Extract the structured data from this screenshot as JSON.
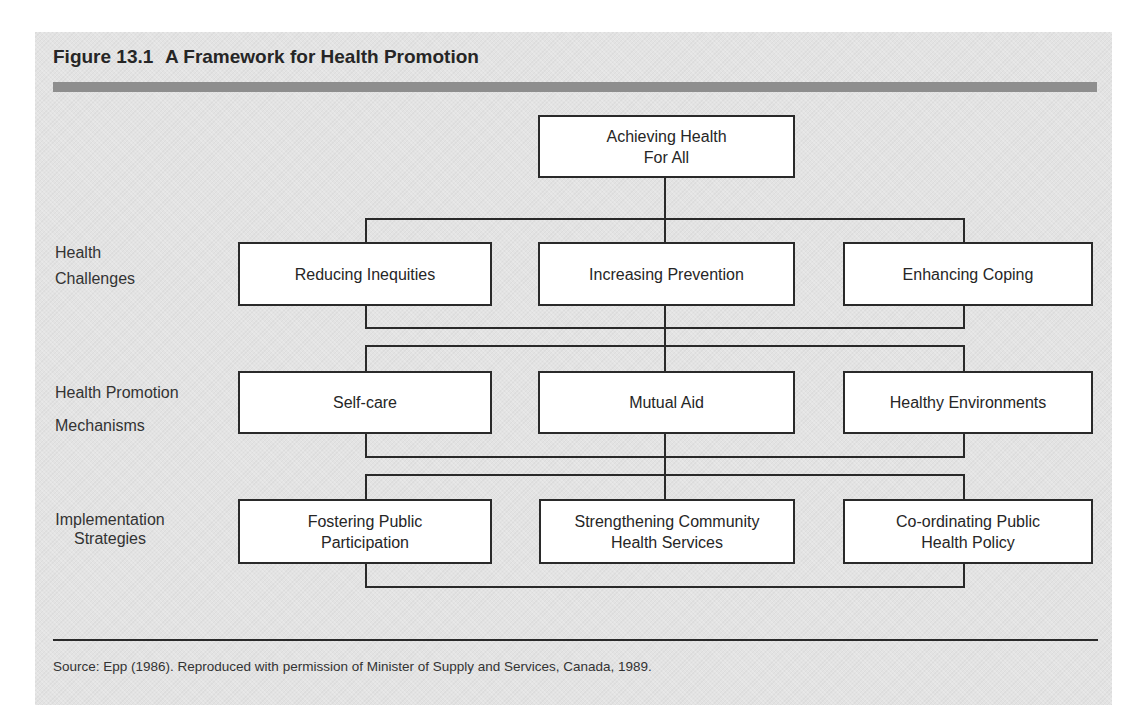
{
  "figure": {
    "number": "Figure 13.1",
    "title": "A Framework for Health Promotion",
    "source": "Source:  Epp (1986). Reproduced with permission of Minister of Supply and Services, Canada, 1989."
  },
  "diagram": {
    "root": {
      "line1": "Achieving Health",
      "line2": "For All"
    },
    "rows": [
      {
        "label_line1": "Health",
        "label_line2": "Challenges",
        "boxes": [
          {
            "line1": "Reducing Inequities",
            "line2": ""
          },
          {
            "line1": "Increasing Prevention",
            "line2": ""
          },
          {
            "line1": "Enhancing Coping",
            "line2": ""
          }
        ]
      },
      {
        "label_line1": "Health Promotion",
        "label_line2": "Mechanisms",
        "boxes": [
          {
            "line1": "Self-care",
            "line2": ""
          },
          {
            "line1": "Mutual Aid",
            "line2": ""
          },
          {
            "line1": "Healthy Environments",
            "line2": ""
          }
        ]
      },
      {
        "label_line1": "Implementation",
        "label_line2": "Strategies",
        "boxes": [
          {
            "line1": "Fostering Public",
            "line2": "Participation"
          },
          {
            "line1": "Strengthening Community",
            "line2": "Health Services"
          },
          {
            "line1": "Co-ordinating Public",
            "line2": "Health Policy"
          }
        ]
      }
    ]
  },
  "colors": {
    "panel": "#e3e3e3",
    "band": "#8e8e8e",
    "line": "#2a2a2a",
    "box_fill": "#ffffff"
  }
}
